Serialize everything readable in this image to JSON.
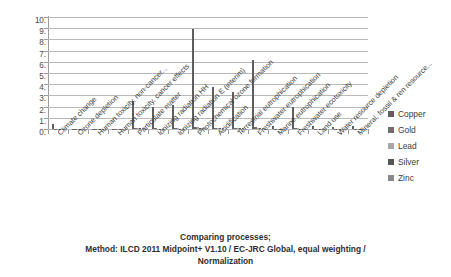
{
  "chart_data": {
    "type": "bar",
    "title": "",
    "xlabel": "",
    "ylabel": "",
    "ylim": [
      0,
      10
    ],
    "grid": true,
    "legend_position": "right",
    "ytick_labels": [
      "10.",
      "9.",
      "8.",
      "7.",
      "6.",
      "5.",
      "4.",
      "3.",
      "2.",
      "1.",
      "0."
    ],
    "ytick_values": [
      10,
      9,
      8,
      7,
      6,
      5,
      4,
      3,
      2,
      1,
      0
    ],
    "categories": [
      "Climate change",
      "Ozone depletion",
      "Human toxicity, non-cancer...",
      "Human toxicity, cancer effects",
      "Particulate matter",
      "Ionizing radiation HH",
      "Ionizing radiation E (interim)",
      "Photochemical ozone formation",
      "Acidification",
      "Terrestrial eutrophication",
      "Freshwater eutrophication",
      "Marine eutrophication",
      "Freshwater ecotoxicity",
      "Land use",
      "Water resource depletion",
      "Mineral, fossil & ren resource..."
    ],
    "series": [
      {
        "name": "Copper",
        "color": "#5e5e5e",
        "values": [
          0.45,
          0.02,
          0.03,
          0.02,
          2.5,
          2.0,
          2.1,
          8.9,
          3.75,
          3.3,
          6.2,
          0.3,
          2.0,
          0.3,
          0.22,
          0.25
        ]
      },
      {
        "name": "Gold",
        "color": "#6e6e6e",
        "values": [
          0.02,
          0.01,
          0.01,
          0.01,
          0.1,
          0.05,
          0.06,
          0.18,
          0.1,
          0.08,
          0.14,
          0.03,
          0.06,
          0.02,
          0.02,
          0.02
        ]
      },
      {
        "name": "Lead",
        "color": "#a8a8a8",
        "values": [
          0.02,
          0.01,
          0.01,
          0.01,
          0.08,
          0.04,
          0.05,
          0.14,
          0.08,
          0.07,
          0.11,
          0.02,
          0.05,
          0.02,
          0.02,
          0.02
        ]
      },
      {
        "name": "Silver",
        "color": "#555555",
        "values": [
          0.02,
          0.01,
          0.01,
          0.01,
          0.07,
          0.04,
          0.04,
          0.12,
          0.07,
          0.06,
          0.1,
          0.02,
          0.04,
          0.02,
          0.02,
          0.02
        ]
      },
      {
        "name": "Zinc",
        "color": "#8a8a8a",
        "values": [
          0.02,
          0.01,
          0.01,
          0.01,
          0.06,
          0.03,
          0.04,
          0.1,
          0.06,
          0.05,
          0.09,
          0.02,
          0.04,
          0.02,
          0.02,
          0.02
        ]
      }
    ]
  },
  "legend": {
    "items": [
      {
        "label": "Copper",
        "color": "#5e5e5e"
      },
      {
        "label": "Gold",
        "color": "#6e6e6e"
      },
      {
        "label": "Lead",
        "color": "#a8a8a8"
      },
      {
        "label": "Silver",
        "color": "#555555"
      },
      {
        "label": "Zinc",
        "color": "#8a8a8a"
      }
    ]
  },
  "caption": {
    "line1": "Comparing processes;",
    "line2": "Method: ILCD 2011 Midpoint+ V1.10 / EC-JRC Global, equal weighting /",
    "line3": "Normalization"
  }
}
